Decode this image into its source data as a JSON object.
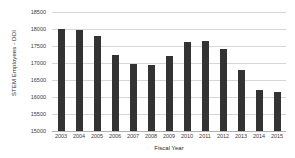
{
  "chart_data": {
    "type": "bar",
    "title": "",
    "xlabel": "Fiscal Year",
    "ylabel": "STEM Employees - DOI",
    "categories": [
      "2003",
      "2004",
      "2005",
      "2006",
      "2007",
      "2008",
      "2009",
      "2010",
      "2011",
      "2012",
      "2013",
      "2014",
      "2015"
    ],
    "values": [
      18000,
      17970,
      17790,
      17250,
      16970,
      16950,
      17210,
      17620,
      17640,
      17400,
      16790,
      16220,
      16140
    ],
    "ylim": [
      15000,
      18500
    ],
    "yticks": [
      18500,
      18000,
      17500,
      17000,
      16500,
      16000,
      15500,
      15000
    ],
    "ytick_labels": [
      "18500",
      "18000",
      "17500",
      "17000",
      "16500",
      "16000",
      "15500",
      "15000"
    ],
    "grid": true,
    "legend": false,
    "bar_color": "#333333",
    "grid_color": "#d6d6d6",
    "axis_color": "#b0b0b0",
    "background": "#ffffff"
  }
}
